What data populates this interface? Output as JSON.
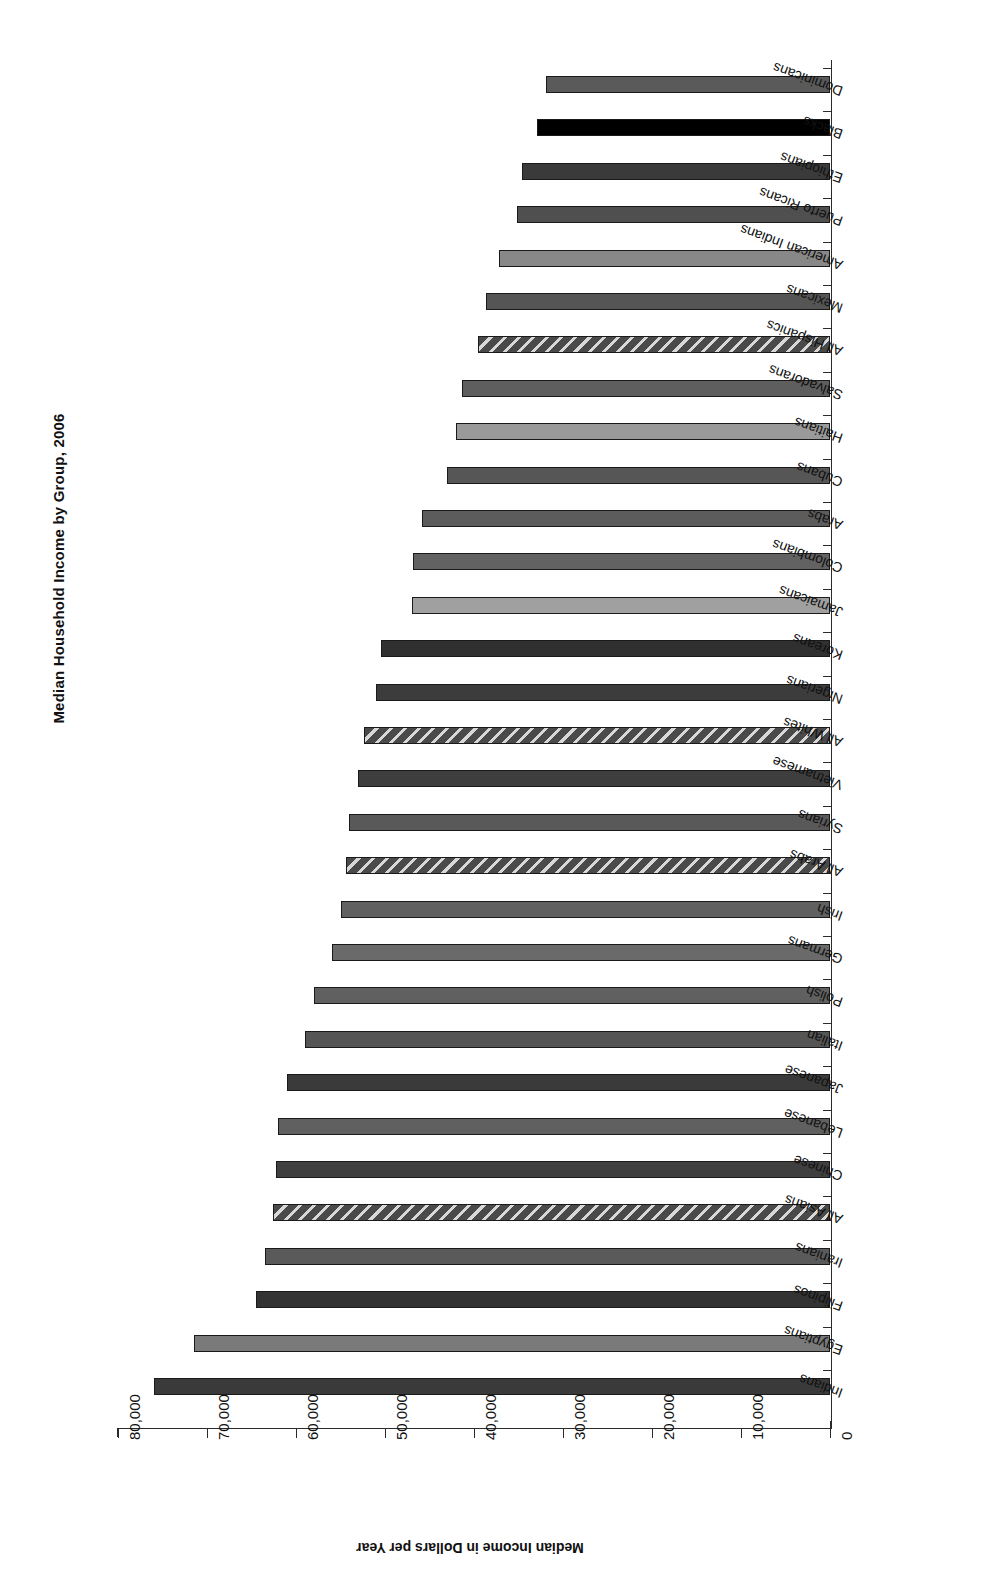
{
  "chart_data": {
    "type": "bar",
    "orientation": "horizontal",
    "title": "Median Household Income by Group, 2006",
    "xlabel": "",
    "ylabel": "Median Income in Dollars per Year",
    "value_axis_title": "Median Income in Dollars per Year",
    "ylim": [
      0,
      80000
    ],
    "tick_values": [
      0,
      10000,
      20000,
      30000,
      40000,
      50000,
      60000,
      70000,
      80000
    ],
    "tick_labels": [
      "0",
      "10,000",
      "20,000",
      "30,000",
      "40,000",
      "50,000",
      "60,000",
      "70,000",
      "80,000"
    ],
    "grid": false,
    "legend": "none",
    "rotated_180": true,
    "categories": [
      "Dominicans",
      "Blacks",
      "Ethiopians",
      "Puerto Ricans",
      "American Indians",
      "Mexicans",
      "All Hispanics",
      "Salvadorans",
      "Haitians",
      "Cubans",
      "Arabs",
      "Colombians",
      "Jamaicans",
      "Koreans",
      "Nigerians",
      "All Whites",
      "Vietnamese",
      "Syrians",
      "All Arabs",
      "Irish",
      "Germans",
      "Polish",
      "Italian",
      "Japanese",
      "Lebanese",
      "Chinese",
      "All Asians",
      "Iranians",
      "Filipinos",
      "Egyptians",
      "Indians"
    ],
    "values": [
      31900,
      32900,
      34600,
      35200,
      37200,
      38700,
      39600,
      41400,
      42000,
      43000,
      45800,
      46800,
      47000,
      50500,
      51000,
      52400,
      53000,
      54000,
      54400,
      55000,
      56000,
      58000,
      59000,
      61000,
      62000,
      62300,
      62600,
      63500,
      64500,
      71500,
      76000
    ],
    "bar_styles": [
      {
        "fill": "#5a5a5a",
        "pattern": "solid"
      },
      {
        "fill": "#000000",
        "pattern": "solid"
      },
      {
        "fill": "#3a3a3a",
        "pattern": "solid"
      },
      {
        "fill": "#4f4f4f",
        "pattern": "solid"
      },
      {
        "fill": "#888888",
        "pattern": "solid"
      },
      {
        "fill": "#555555",
        "pattern": "solid"
      },
      {
        "fill": "#4a4a4a",
        "pattern": "hatch"
      },
      {
        "fill": "#5e5e5e",
        "pattern": "solid"
      },
      {
        "fill": "#9a9a9a",
        "pattern": "solid"
      },
      {
        "fill": "#565656",
        "pattern": "solid"
      },
      {
        "fill": "#5c5c5c",
        "pattern": "solid"
      },
      {
        "fill": "#626262",
        "pattern": "solid"
      },
      {
        "fill": "#a0a0a0",
        "pattern": "solid"
      },
      {
        "fill": "#303030",
        "pattern": "solid"
      },
      {
        "fill": "#3c3c3c",
        "pattern": "solid"
      },
      {
        "fill": "#4a4a4a",
        "pattern": "hatch"
      },
      {
        "fill": "#3e3e3e",
        "pattern": "solid"
      },
      {
        "fill": "#595959",
        "pattern": "solid"
      },
      {
        "fill": "#4a4a4a",
        "pattern": "hatch"
      },
      {
        "fill": "#606060",
        "pattern": "solid"
      },
      {
        "fill": "#6a6a6a",
        "pattern": "solid"
      },
      {
        "fill": "#606060",
        "pattern": "solid"
      },
      {
        "fill": "#555555",
        "pattern": "solid"
      },
      {
        "fill": "#3a3a3a",
        "pattern": "solid"
      },
      {
        "fill": "#606060",
        "pattern": "solid"
      },
      {
        "fill": "#3f3f3f",
        "pattern": "solid"
      },
      {
        "fill": "#4a4a4a",
        "pattern": "hatch"
      },
      {
        "fill": "#5a5a5a",
        "pattern": "solid"
      },
      {
        "fill": "#333333",
        "pattern": "solid"
      },
      {
        "fill": "#7a7a7a",
        "pattern": "solid"
      },
      {
        "fill": "#3a3a3a",
        "pattern": "solid"
      }
    ]
  },
  "colors": {
    "axis": "#2b2b2b",
    "text": "#111111",
    "background": "#ffffff"
  }
}
